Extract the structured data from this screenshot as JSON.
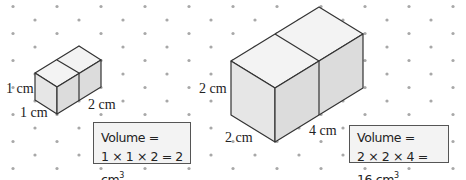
{
  "grid": {
    "dot_color": "#a8a8a8",
    "h_spacing": 44,
    "v_spacing": 13.5
  },
  "colors": {
    "edge": "#333333",
    "top_face": "#f3f3f3",
    "front_face": "#e9e9e9",
    "side_face": "#dedede",
    "box_border": "#555555",
    "box_fill": "#f3f3f3"
  },
  "small_prism": {
    "labels": {
      "height": "1 cm",
      "width": "1 cm",
      "length": "2 cm"
    },
    "volume": {
      "line1": "Volume =",
      "line2": "1 × 1 × 2 = 2 cm",
      "unit_exp": "3"
    }
  },
  "large_prism": {
    "labels": {
      "height": "2 cm",
      "width": "2 cm",
      "length": "4 cm"
    },
    "volume": {
      "line1": "Volume =",
      "line2": "2 × 2 × 4 = 16 cm",
      "unit_exp": "3"
    }
  }
}
